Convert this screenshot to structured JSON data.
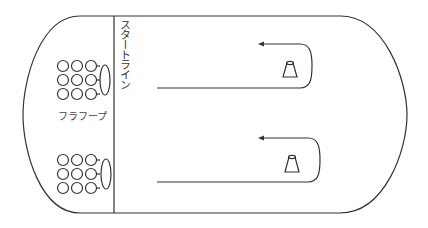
{
  "diagram": {
    "start_line_label": "スタートライン",
    "hoop_label": "フラフープ",
    "stroke_color": "#333333",
    "background": "#ffffff",
    "teams": [
      {
        "name": "team-top",
        "circles_rows": 3,
        "circles_cols": 3
      },
      {
        "name": "team-bottom",
        "circles_rows": 3,
        "circles_cols": 3
      }
    ],
    "lanes": [
      {
        "name": "lane-top",
        "cone": "cone",
        "direction": "return-left"
      },
      {
        "name": "lane-bottom",
        "cone": "cone",
        "direction": "return-left"
      }
    ]
  }
}
